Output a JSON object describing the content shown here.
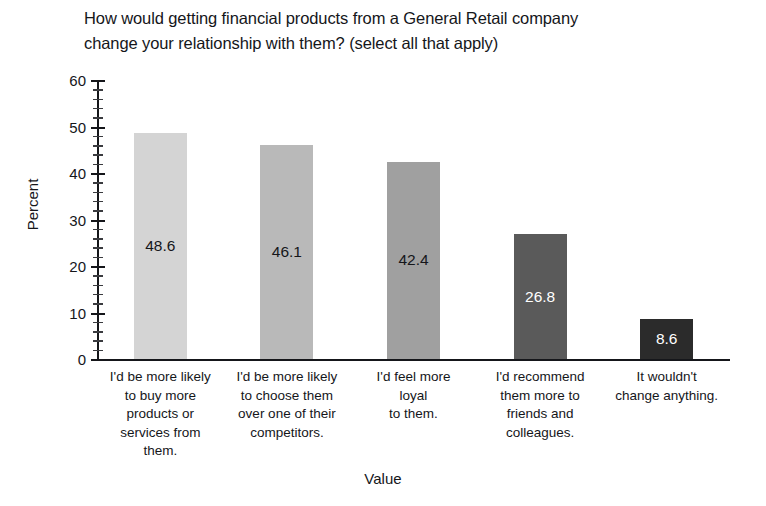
{
  "chart_data": {
    "type": "bar",
    "title": "How would getting financial products from a General Retail company\nchange your relationship with them? (select all that apply)",
    "xlabel": "Value",
    "ylabel": "Percent",
    "ylim": [
      0,
      60
    ],
    "ytick_labels": [
      "0",
      "10",
      "20",
      "30",
      "40",
      "50",
      "60"
    ],
    "ytick_values": [
      0,
      10,
      20,
      30,
      40,
      50,
      60
    ],
    "minor_tick_step": 2,
    "grid": false,
    "legend": false,
    "categories": [
      "I'd be more likely\nto buy more\nproducts or\nservices from\nthem.",
      "I'd be more likely\nto choose them\nover one of their\ncompetitors.",
      "I'd feel more\nloyal\nto them.",
      "I'd recommend\nthem more to\nfriends and\ncolleagues.",
      "It wouldn't\nchange anything."
    ],
    "values": [
      48.6,
      46.1,
      42.4,
      26.8,
      8.6
    ],
    "value_labels": [
      "48.6",
      "46.1",
      "42.4",
      "26.8",
      "8.6"
    ],
    "bar_colors": [
      "#d4d4d4",
      "#b9b9b9",
      "#a0a0a0",
      "#5a5a5a",
      "#2b2b2b"
    ],
    "value_label_colors": [
      "#15161a",
      "#15161a",
      "#15161a",
      "#ffffff",
      "#ffffff"
    ],
    "axis_color": "#15161a",
    "background_color": "#ffffff"
  }
}
